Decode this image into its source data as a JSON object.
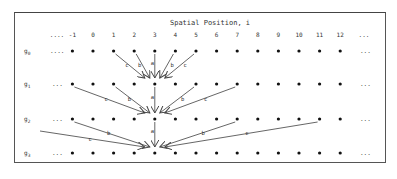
{
  "title": "Spatial Position, i",
  "column_labels": [
    "....",
    "-1",
    "0",
    "1",
    "2",
    "3",
    "4",
    "5",
    "6",
    "7",
    "8",
    "9",
    "10",
    "11",
    "12",
    "..."
  ],
  "row_labels": [
    "g0",
    "g1",
    "g2",
    "g3"
  ],
  "edge_weights": [
    "a",
    "b",
    "c"
  ],
  "chart_data": {
    "type": "diagram",
    "title": "Spatial Position, i",
    "positions": [
      -1,
      0,
      1,
      2,
      3,
      4,
      5,
      6,
      7,
      8,
      9,
      10,
      11,
      12
    ],
    "levels": [
      "g0",
      "g1",
      "g2",
      "g3"
    ],
    "edges": [
      {
        "from_level": "g0",
        "to_level": "g1",
        "to_pos": 3,
        "from_pos": [
          1,
          2,
          3,
          4,
          5
        ],
        "weights": [
          "c",
          "b",
          "a",
          "b",
          "c"
        ]
      },
      {
        "from_level": "g1",
        "to_level": "g2",
        "to_pos": 3,
        "from_pos": [
          -1,
          1,
          3,
          5,
          7
        ],
        "weights": [
          "c",
          "b",
          "a",
          "b",
          "c"
        ]
      },
      {
        "from_level": "g2",
        "to_level": "g3",
        "to_pos": 3,
        "from_pos": [
          -5,
          -1,
          3,
          7,
          11
        ],
        "weights": [
          "c",
          "b",
          "a",
          "b",
          "c"
        ]
      }
    ]
  }
}
